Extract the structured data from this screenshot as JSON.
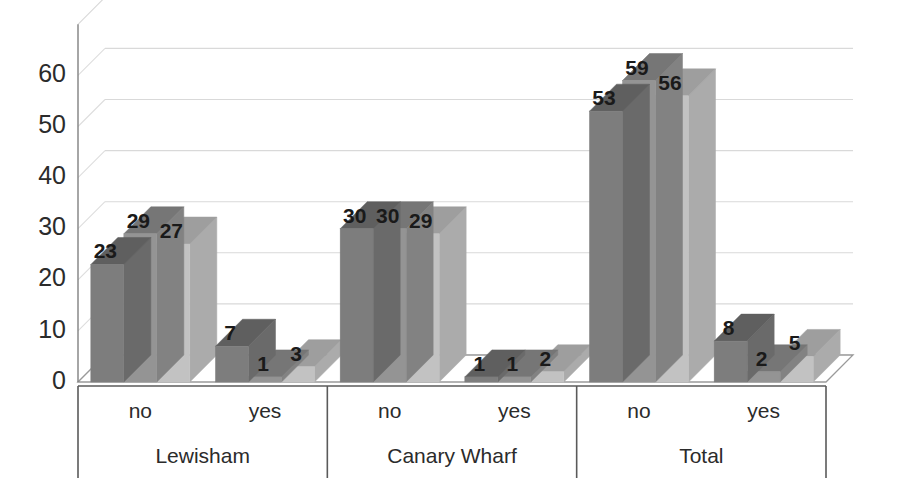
{
  "chart_data": {
    "type": "bar",
    "title": "",
    "subtitle": "",
    "xlabel": "",
    "ylabel": "",
    "ylim": [
      0,
      70
    ],
    "yticks": [
      0,
      10,
      20,
      30,
      40,
      50,
      60
    ],
    "ytick_labels": [
      "0",
      "10",
      "20",
      "30",
      "40",
      "50",
      "60"
    ],
    "grid": true,
    "grid_axis": "y",
    "legend": false,
    "legend_position": "none",
    "three_d": true,
    "categories": [
      "no",
      "yes",
      "no",
      "yes",
      "no",
      "yes"
    ],
    "groups": [
      {
        "label": "Lewisham",
        "categories": [
          "no",
          "yes"
        ]
      },
      {
        "label": "Canary Wharf",
        "categories": [
          "no",
          "yes"
        ]
      },
      {
        "label": "Total",
        "categories": [
          "no",
          "yes"
        ]
      }
    ],
    "series": [
      {
        "name": "Series 1",
        "color": "#7d7d7d",
        "values": [
          23,
          7,
          30,
          1,
          53,
          8
        ]
      },
      {
        "name": "Series 2",
        "color": "#949494",
        "values": [
          29,
          1,
          30,
          1,
          59,
          2
        ]
      },
      {
        "name": "Series 3",
        "color": "#c2c2c2",
        "values": [
          27,
          3,
          29,
          2,
          56,
          5
        ]
      }
    ],
    "data_labels": [
      [
        "23",
        "7",
        "30",
        "1",
        "53",
        "8"
      ],
      [
        "29",
        "1",
        "30",
        "1",
        "59",
        "2"
      ],
      [
        "27",
        "3",
        "29",
        "2",
        "56",
        "5"
      ]
    ],
    "colors": {
      "series_1_front": "#7d7d7d",
      "series_1_top": "#5f5f5f",
      "series_1_side": "#6a6a6a",
      "series_2_front": "#949494",
      "series_2_top": "#767676",
      "series_2_side": "#828282",
      "series_3_front": "#c2c2c2",
      "series_3_top": "#9e9e9e",
      "series_3_side": "#ababab",
      "gridline": "#d9d9d9",
      "axis": "#808080",
      "text": "#2b2b2b",
      "background": "#ffffff"
    }
  },
  "axis": {
    "y_ticks": [
      "0",
      "10",
      "20",
      "30",
      "40",
      "50",
      "60"
    ]
  },
  "category_row": {
    "labels": [
      "no",
      "yes",
      "no",
      "yes",
      "no",
      "yes"
    ]
  },
  "group_row": {
    "labels": [
      "Lewisham",
      "Canary Wharf",
      "Total"
    ]
  }
}
